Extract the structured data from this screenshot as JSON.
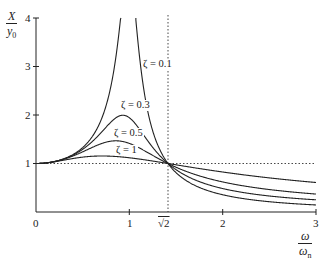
{
  "chart_data": {
    "type": "line",
    "title": "",
    "xlabel": "ω/ωn",
    "ylabel": "X/y0",
    "xlim": [
      0,
      3
    ],
    "ylim": [
      0,
      4
    ],
    "grid": false,
    "x_ticks": [
      "0",
      "1",
      "√2",
      "2",
      "3"
    ],
    "y_ticks": [
      "1",
      "2",
      "3",
      "4"
    ],
    "reference_lines": [
      {
        "type": "horizontal",
        "y": 1,
        "style": "dotted"
      },
      {
        "type": "vertical",
        "x": 1.414,
        "style": "dotted",
        "label": "√2"
      }
    ],
    "series": [
      {
        "name": "ζ = 0.1",
        "zeta": 0.1,
        "label": "ζ = 0.1"
      },
      {
        "name": "ζ = 0.3",
        "zeta": 0.3,
        "label": "ζ = 0.3"
      },
      {
        "name": "ζ = 0.5",
        "zeta": 0.5,
        "label": "ζ = 0.5"
      },
      {
        "name": "ζ = 1",
        "zeta": 1,
        "label": "ζ = 1"
      }
    ],
    "annotations": [
      "ζ = 0.1",
      "ζ = 0.3",
      "ζ = 0.5",
      "ζ = 1"
    ],
    "sample_values": {
      "x": [
        0,
        0.5,
        1.0,
        1.414,
        2.0,
        3.0
      ],
      "zeta_0.1": [
        1.0,
        1.34,
        5.1,
        1.0,
        0.37,
        0.15
      ],
      "zeta_0.3": [
        1.0,
        1.3,
        1.94,
        1.0,
        0.5,
        0.26
      ],
      "zeta_0.5": [
        1.0,
        1.25,
        1.41,
        1.0,
        0.59,
        0.36
      ],
      "zeta_1": [
        1.0,
        1.13,
        1.12,
        1.0,
        0.72,
        0.6
      ]
    }
  },
  "axes": {
    "y_label_num": "X",
    "y_label_den": "y",
    "y_label_den_sub": "0",
    "x_label_num": "ω",
    "x_label_den": "ω",
    "x_label_den_sub": "n",
    "x_tick_labels": [
      "0",
      "1",
      "2",
      "3"
    ],
    "sqrt2_label": "√2",
    "y_tick_labels": [
      "1",
      "2",
      "3",
      "4"
    ]
  },
  "curve_labels": [
    "ζ = 0.1",
    "ζ = 0.3",
    "ζ = 0.5",
    "ζ = 1"
  ]
}
